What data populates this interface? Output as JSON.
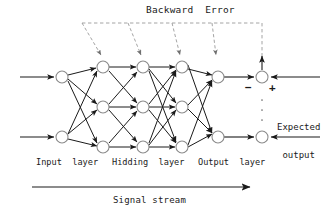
{
  "figure": {
    "title": "Backward  Error",
    "signal_stream_label": "Signal stream",
    "expected_output_line1": "Expected",
    "expected_output_line2": "output",
    "minus_sign": "−",
    "plus_sign": "+",
    "layer_labels": {
      "input": "Input  layer",
      "hidden": "Hidding  layer",
      "output": "Output  layer"
    },
    "colors": {
      "stroke": "#1a1a1a",
      "node_fill": "#ffffff",
      "node_stroke": "#8a8a8a",
      "dashed": "#9a9a9a",
      "background": "#ffffff"
    }
  },
  "network": {
    "node_radius": 6,
    "layers": [
      {
        "name": "input",
        "x": 62,
        "count": 2,
        "ys": [
          77,
          137
        ]
      },
      {
        "name": "hidden1",
        "x": 103,
        "count": 3,
        "ys": [
          67,
          107,
          147
        ]
      },
      {
        "name": "hidden2",
        "x": 143,
        "count": 3,
        "ys": [
          67,
          107,
          147
        ]
      },
      {
        "name": "hidden3",
        "x": 182,
        "count": 3,
        "ys": [
          67,
          107,
          147
        ]
      },
      {
        "name": "output",
        "x": 218,
        "count": 2,
        "ys": [
          77,
          137
        ]
      }
    ],
    "summation_nodes": [
      {
        "x": 262,
        "y": 77
      },
      {
        "x": 262,
        "y": 137
      }
    ],
    "input_arrow_start_x": 20,
    "external_arrow_end_x": 320,
    "backward_error_line_y": 23,
    "backward_error_line_x1": 82,
    "backward_error_line_x2": 262,
    "backward_drop_targets": [
      {
        "x": 103,
        "y": 58
      },
      {
        "x": 143,
        "y": 58
      },
      {
        "x": 182,
        "y": 58
      },
      {
        "x": 218,
        "y": 58
      }
    ],
    "signal_arrow": {
      "x1": 32,
      "x2": 250,
      "y": 187
    }
  }
}
